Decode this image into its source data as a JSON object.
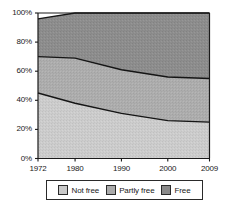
{
  "chart_data": {
    "type": "area",
    "title": "",
    "subtitle": "",
    "xlabel": "",
    "ylabel": "",
    "stacked": true,
    "stacked_to_total": false,
    "grid": false,
    "legend_position": "bottom",
    "categories": [
      "1972",
      "1980",
      "1990",
      "2000",
      "2009"
    ],
    "x": [
      1972,
      1980,
      1990,
      2000,
      2009
    ],
    "xlim": [
      1972,
      2009
    ],
    "ylim": [
      0,
      100
    ],
    "yticks": [
      0,
      20,
      40,
      60,
      80,
      100
    ],
    "ytick_labels": [
      "0%",
      "20%",
      "40%",
      "60%",
      "80%",
      "100%"
    ],
    "xticks": [
      1972,
      1980,
      1990,
      2000,
      2009
    ],
    "xtick_labels": [
      "1972",
      "1980",
      "1990",
      "2000",
      "2009"
    ],
    "series": [
      {
        "name": "Not free",
        "color": "#c9c9c9",
        "values": [
          45,
          38,
          31,
          26,
          25
        ],
        "cumulative_top": [
          45,
          38,
          31,
          26,
          25
        ]
      },
      {
        "name": "Partly free",
        "color": "#aaaaaa",
        "values": [
          25,
          31,
          30,
          30,
          30
        ],
        "cumulative_top": [
          70,
          69,
          61,
          56,
          55
        ]
      },
      {
        "name": "Free",
        "color": "#8a8a8a",
        "values": [
          26,
          31,
          39,
          44,
          45
        ],
        "cumulative_top": [
          96,
          100,
          100,
          100,
          100
        ]
      }
    ]
  },
  "axes": {
    "y_labels": [
      "100%",
      "80%",
      "60%",
      "40%",
      "20%",
      "0%"
    ],
    "x_labels": [
      "1972",
      "1980",
      "1990",
      "2000",
      "2009"
    ]
  },
  "legend": {
    "items": [
      {
        "label": "Not free",
        "color": "#c9c9c9"
      },
      {
        "label": "Partly free",
        "color": "#aaaaaa"
      },
      {
        "label": "Free",
        "color": "#8a8a8a"
      }
    ]
  },
  "colors": {
    "axis": "#1a1a1a",
    "outline": "#1a1a1a",
    "background": "#ffffff",
    "not_free": "#c9c9c9",
    "partly_free": "#aaaaaa",
    "free": "#8a8a8a"
  }
}
